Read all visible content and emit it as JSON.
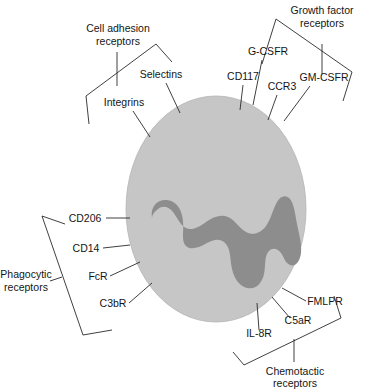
{
  "figure": {
    "colors": {
      "cytoplasm": "#c6c6c6",
      "nucleus": "#8d8d8d",
      "line": "#2a2a2a",
      "text": "#151515",
      "background": "#ffffff"
    }
  },
  "cell": {
    "name": "phagocyte",
    "cytoplasm_label": "",
    "nucleus_label": ""
  },
  "groups": {
    "cell_adhesion": {
      "line1": "Cell adhesion",
      "line2": "receptors"
    },
    "growth_factor": {
      "line1": "Growth factor",
      "line2": "receptors"
    },
    "phagocytic": {
      "line1": "Phagocytic",
      "line2": "receptors"
    },
    "chemotactic": {
      "line1": "Chemotactic",
      "line2": "receptors"
    }
  },
  "receptors": {
    "selectins": "Selectins",
    "integrins": "Integrins",
    "cd117": "CD117",
    "gcsfr": "G-CSFR",
    "ccr3": "CCR3",
    "gmcsfr": "GM-CSFR",
    "cd206": "CD206",
    "cd14": "CD14",
    "fcr": "FcR",
    "c3br": "C3bR",
    "il8r": "IL-8R",
    "c5ar": "C5aR",
    "fmlpr": "FMLPR"
  }
}
